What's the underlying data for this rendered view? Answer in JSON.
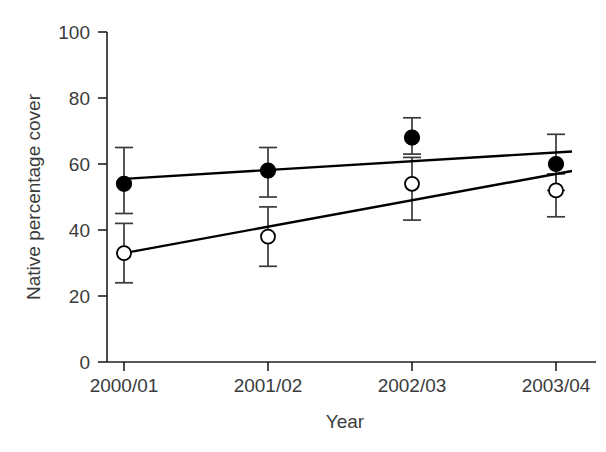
{
  "chart_data": {
    "type": "scatter",
    "title": "",
    "subtitle": "",
    "xlabel": "Year",
    "ylabel": "Native percentage cover",
    "categories": [
      "2000/01",
      "2001/02",
      "2002/03",
      "2003/04"
    ],
    "xticklabels": [
      "2000/01",
      "2001/02",
      "2002/03",
      "2003/04"
    ],
    "yticklabels": [
      "0",
      "20",
      "40",
      "60",
      "80",
      "100"
    ],
    "yticks": [
      0,
      20,
      40,
      60,
      80,
      100
    ],
    "ylim": [
      0,
      100
    ],
    "grid": false,
    "legend": false,
    "legend_position": "none",
    "series": [
      {
        "name": "filled-circle-series",
        "marker": "filled-circle",
        "values": [
          54,
          58,
          68,
          60
        ],
        "err_low": [
          45,
          50,
          63,
          52
        ],
        "err_high": [
          65,
          65,
          74,
          69
        ],
        "trend_start": 55.5,
        "trend_end": 63.5
      },
      {
        "name": "open-circle-series",
        "marker": "open-circle",
        "values": [
          33,
          38,
          54,
          52
        ],
        "err_low": [
          24,
          29,
          43,
          44
        ],
        "err_high": [
          42,
          47,
          62,
          57
        ],
        "trend_start": 33,
        "trend_end": 57
      }
    ],
    "annotations": []
  },
  "axes": {
    "y_tick_0": "0",
    "y_tick_20": "20",
    "y_tick_40": "40",
    "y_tick_60": "60",
    "y_tick_80": "80",
    "y_tick_100": "100",
    "x_tick_1": "2000/01",
    "x_tick_2": "2001/02",
    "x_tick_3": "2002/03",
    "x_tick_4": "2003/04",
    "x_axis_title": "Year",
    "y_axis_title": "Native percentage cover"
  },
  "colors": {
    "background": "#ffffff",
    "axis": "#231f20",
    "text": "#3b3b3b",
    "marker_filled": "#000000",
    "marker_open_fill": "#ffffff",
    "line": "#000000",
    "error_bar": "#3a3a3a"
  }
}
